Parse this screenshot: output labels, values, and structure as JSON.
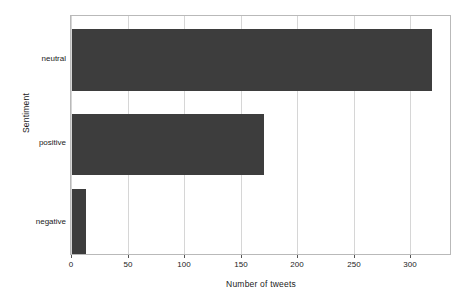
{
  "chart_data": {
    "type": "bar",
    "orientation": "horizontal",
    "title": "",
    "xlabel": "Number of tweets",
    "ylabel": "Sentiment",
    "categories": [
      "negative",
      "positive",
      "neutral"
    ],
    "values": [
      12,
      170,
      318
    ],
    "xlim": [
      0,
      335
    ],
    "xticks": [
      0,
      50,
      100,
      150,
      200,
      250,
      300
    ],
    "xticklabels": [
      "0",
      "50",
      "100",
      "150",
      "200",
      "250",
      "300"
    ],
    "grid": true,
    "grid_axis": "x",
    "legend": null,
    "bar_color": "#3d3d3d",
    "grid_color": "#d6d6d6",
    "frame_color": "#b9b9b9",
    "background": "#ffffff"
  },
  "axes": {
    "x_title": "Number of tweets",
    "y_title": "Sentiment"
  },
  "bars": [
    {
      "label": "neutral",
      "value": 318
    },
    {
      "label": "positive",
      "value": 170
    },
    {
      "label": "negative",
      "value": 12
    }
  ],
  "ticks": {
    "x": [
      "0",
      "50",
      "100",
      "150",
      "200",
      "250",
      "300"
    ]
  }
}
